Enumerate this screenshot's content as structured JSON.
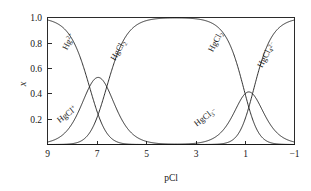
{
  "figure": {
    "name": "mercury-chloride-speciation-diagram",
    "background_color": "#ffffff",
    "line_color": "#1a1a1a",
    "frame_color": "#2b2b2b"
  },
  "chart_data": {
    "type": "line",
    "title": "",
    "subtitle": "",
    "xlabel": "pCl",
    "ylabel": "x",
    "xlim": [
      9,
      -1
    ],
    "ylim": [
      0,
      1.0
    ],
    "x_ticks": [
      9,
      7,
      5,
      3,
      1,
      -1
    ],
    "x_tick_labels": [
      "9",
      "7",
      "5",
      "3",
      "1",
      "−1"
    ],
    "y_ticks": [
      0.2,
      0.4,
      0.6,
      0.8,
      1.0
    ],
    "y_tick_labels": [
      "0.2",
      "0.4",
      "0.6",
      "0.8",
      "1.0"
    ],
    "x_axis_direction": "decreasing",
    "grid": false,
    "legend": "inline-curve-labels",
    "log_beta": [
      7.3,
      13.9,
      14.9,
      15.6
    ],
    "series": [
      {
        "name": "Hg2+",
        "label_html": "Hg<sup>2+</sup>",
        "label_text": "Hg2+",
        "label_x": 8.05,
        "label_y": 0.8,
        "label_rotation": -62,
        "description": "free mercury(II) ion, dominant at high pCl"
      },
      {
        "name": "HgCl+",
        "label_html": "HgCl<sup>+</sup>",
        "label_text": "HgCl+",
        "label_x": 8.15,
        "label_y": 0.22,
        "label_rotation": -38,
        "peak_pcl": 7.3,
        "peak_x": 0.39,
        "description": "monochloro complex, maximum near pCl 7.3"
      },
      {
        "name": "HgCl2",
        "label_html": "HgCl<sub>2</sub>",
        "label_text": "HgCl2",
        "label_x": 6.05,
        "label_y": 0.73,
        "label_rotation": -60,
        "description": "neutral dichloro complex, dominant plateau pCl 5 to 3"
      },
      {
        "name": "HgCl3-",
        "label_html": "HgCl<sub>3</sub><sup>−</sup>",
        "label_text": "HgCl3-",
        "label_x": 2.55,
        "label_y": 0.2,
        "label_rotation": -38,
        "peak_pcl": 1.0,
        "peak_x": 0.31,
        "description": "trichloro complex, maximum near pCl 1.0"
      },
      {
        "name": "HgCl2-4",
        "label_html": "HgCl<sub>4</sub><sup>2−</sup>",
        "label_text": "HgCl42-",
        "label_x": 0.05,
        "label_y": 0.7,
        "label_rotation": -63,
        "description": "tetrachloro complex, dominant at low pCl"
      },
      {
        "name": "HgCl2-right",
        "label_html": "HgCl<sub>2</sub>",
        "label_text": "HgCl2",
        "label_x": 2.1,
        "label_y": 0.8,
        "label_rotation": -62,
        "description": "descending branch of the dichloro complex"
      }
    ]
  }
}
